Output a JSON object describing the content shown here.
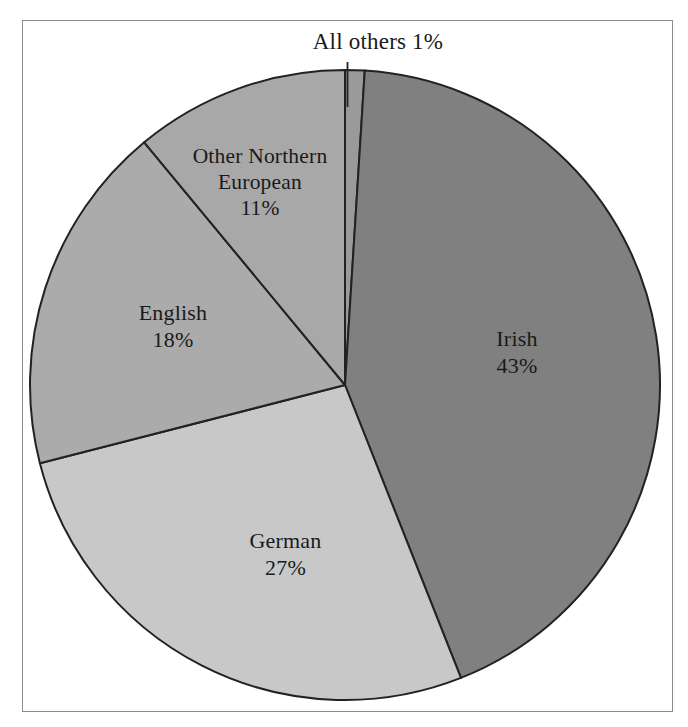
{
  "figure": {
    "background_color": "#ffffff",
    "frame_color": "#8d8d8d",
    "divider_color": "#222222"
  },
  "chart_data": {
    "type": "pie",
    "title": "",
    "subtitle": "",
    "xlabel": "",
    "ylabel": "",
    "legend_position": "none",
    "grid": false,
    "label_format": "name + percent",
    "start_angle_deg": 0,
    "direction": "clockwise",
    "total_percent": 100,
    "categories": [
      "All others",
      "Irish",
      "German",
      "English",
      "Other Northern European"
    ],
    "values": [
      1,
      43,
      27,
      18,
      11
    ],
    "slices": [
      {
        "name": "All others",
        "value": 1,
        "percent_label": "1%",
        "color": "#9a9a9a",
        "label_lines": [
          "All others 1%"
        ],
        "label_placement": "outside-top",
        "has_leader_line": true
      },
      {
        "name": "Irish",
        "value": 43,
        "percent_label": "43%",
        "color": "#808080",
        "label_lines": [
          "Irish",
          "43%"
        ],
        "label_placement": "inside",
        "has_leader_line": false
      },
      {
        "name": "German",
        "value": 27,
        "percent_label": "27%",
        "color": "#c8c8c8",
        "label_lines": [
          "German",
          "27%"
        ],
        "label_placement": "inside",
        "has_leader_line": false
      },
      {
        "name": "English",
        "value": 18,
        "percent_label": "18%",
        "color": "#ababab",
        "label_lines": [
          "English",
          "18%"
        ],
        "label_placement": "inside",
        "has_leader_line": false
      },
      {
        "name": "Other Northern European",
        "value": 11,
        "percent_label": "11%",
        "color": "#a8a8a8",
        "label_lines": [
          "Other Northern",
          "European",
          "11%"
        ],
        "label_placement": "inside",
        "has_leader_line": false
      }
    ]
  },
  "labels": {
    "all_others": {
      "line1": "All others 1%"
    },
    "other_northern_european": {
      "line1": "Other Northern",
      "line2": "European",
      "line3": "11%"
    },
    "english": {
      "line1": "English",
      "line2": "18%"
    },
    "german": {
      "line1": "German",
      "line2": "27%"
    },
    "irish": {
      "line1": "Irish",
      "line2": "43%"
    }
  }
}
